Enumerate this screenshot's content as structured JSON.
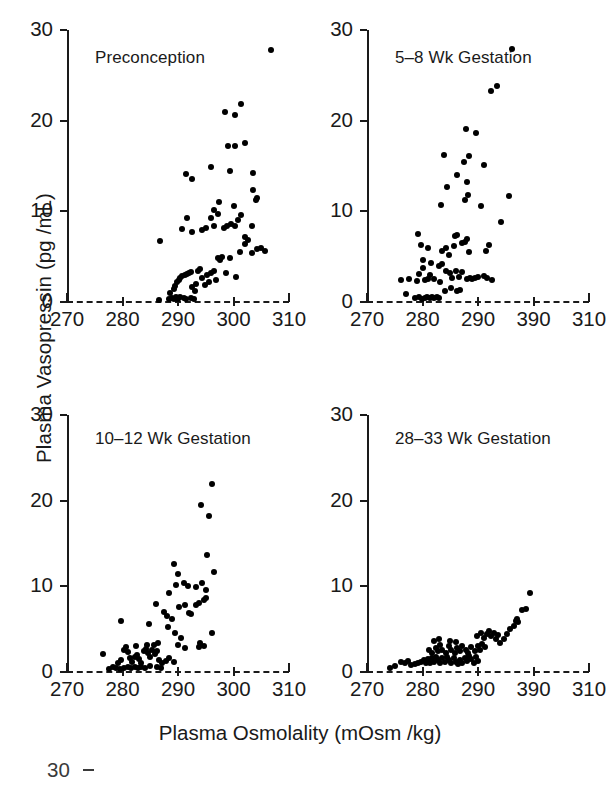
{
  "figure": {
    "xlabel": "Plasma Osmolality (mOsm /kg)",
    "ylabel": "Plasma Vasopressin (pg /mL)",
    "ink_color": "#1a1a1a",
    "marker_color": "#000000",
    "background": "#ffffff",
    "next_figure_fragment": {
      "ytick_label": "30"
    }
  },
  "chart_data": [
    {
      "type": "scatter",
      "title": "Preconception",
      "panel": "top-left",
      "xlabel": "Plasma Osmolality (mOsm /kg)",
      "ylabel": "Plasma Vasopressin (pg /mL)",
      "xlim": [
        270,
        310
      ],
      "ylim": [
        0,
        30
      ],
      "xticks": [
        270,
        280,
        290,
        300,
        310
      ],
      "xtick_labels": [
        "270",
        "280",
        "290",
        "300",
        "310"
      ],
      "yticks": [
        0,
        10,
        20,
        30
      ],
      "ytick_labels": [
        "0",
        "10",
        "20",
        "30"
      ],
      "grid": false,
      "legend": "none",
      "baseline_style": "dashed",
      "points": [
        [
          286.6,
          0.2
        ],
        [
          288.4,
          0.3
        ],
        [
          288.9,
          0.4
        ],
        [
          289.3,
          0.3
        ],
        [
          289.6,
          0.5
        ],
        [
          290.0,
          0.3
        ],
        [
          290.3,
          0.6
        ],
        [
          291.0,
          0.4
        ],
        [
          291.4,
          0.3
        ],
        [
          292.4,
          0.4
        ],
        [
          292.8,
          0.3
        ],
        [
          288.6,
          1.0
        ],
        [
          289.2,
          1.4
        ],
        [
          289.5,
          1.8
        ],
        [
          289.8,
          2.2
        ],
        [
          290.1,
          2.4
        ],
        [
          290.4,
          2.6
        ],
        [
          290.7,
          2.9
        ],
        [
          291.2,
          3.0
        ],
        [
          291.6,
          3.1
        ],
        [
          292.0,
          3.2
        ],
        [
          292.3,
          3.3
        ],
        [
          292.6,
          1.6
        ],
        [
          293.0,
          1.2
        ],
        [
          293.3,
          2.0
        ],
        [
          293.6,
          3.4
        ],
        [
          293.9,
          3.6
        ],
        [
          294.3,
          2.6
        ],
        [
          294.8,
          1.9
        ],
        [
          295.2,
          3.0
        ],
        [
          295.6,
          2.2
        ],
        [
          296.0,
          3.2
        ],
        [
          296.4,
          3.4
        ],
        [
          296.8,
          2.4
        ],
        [
          297.2,
          4.8
        ],
        [
          297.6,
          4.6
        ],
        [
          298.0,
          5.0
        ],
        [
          298.6,
          3.2
        ],
        [
          299.3,
          4.9
        ],
        [
          300.4,
          2.8
        ],
        [
          301.2,
          5.5
        ],
        [
          302.0,
          6.4
        ],
        [
          303.4,
          5.4
        ],
        [
          304.3,
          5.8
        ],
        [
          305.0,
          6.0
        ],
        [
          305.6,
          5.6
        ],
        [
          286.8,
          6.7
        ],
        [
          290.8,
          8.0
        ],
        [
          291.6,
          9.3
        ],
        [
          292.6,
          7.7
        ],
        [
          294.4,
          7.9
        ],
        [
          295.0,
          8.2
        ],
        [
          296.0,
          9.3
        ],
        [
          296.5,
          8.4
        ],
        [
          297.2,
          9.7
        ],
        [
          298.2,
          8.2
        ],
        [
          298.8,
          8.4
        ],
        [
          299.5,
          8.6
        ],
        [
          300.2,
          8.4
        ],
        [
          300.8,
          9.0
        ],
        [
          301.3,
          9.6
        ],
        [
          302.0,
          7.2
        ],
        [
          302.6,
          6.8
        ],
        [
          303.4,
          8.4
        ],
        [
          304.0,
          11.2
        ],
        [
          304.2,
          11.5
        ],
        [
          303.6,
          12.4
        ],
        [
          300.0,
          10.6
        ],
        [
          297.3,
          11.0
        ],
        [
          296.4,
          10.2
        ],
        [
          291.4,
          14.1
        ],
        [
          292.6,
          13.6
        ],
        [
          295.9,
          14.9
        ],
        [
          299.4,
          14.5
        ],
        [
          303.6,
          14.2
        ],
        [
          299.0,
          17.2
        ],
        [
          300.2,
          17.2
        ],
        [
          302.0,
          17.5
        ],
        [
          300.3,
          20.6
        ],
        [
          298.4,
          21.0
        ],
        [
          301.3,
          21.8
        ],
        [
          306.8,
          27.8
        ]
      ]
    },
    {
      "type": "scatter",
      "title": "5–8 Wk Gestation",
      "panel": "top-right",
      "xlabel": "Plasma Osmolality (mOsm /kg)",
      "ylabel": "Plasma Vasopressin (pg /mL)",
      "xlim": [
        270,
        310
      ],
      "ylim": [
        0,
        30
      ],
      "xticks": [
        270,
        280,
        290,
        300,
        310
      ],
      "xtick_labels": [
        "270",
        "280",
        "290",
        "390",
        "310"
      ],
      "yticks": [
        0,
        10,
        20,
        30
      ],
      "ytick_labels": [
        "0",
        "10",
        "20",
        "30"
      ],
      "grid": false,
      "legend": "none",
      "baseline_style": "dashed",
      "points": [
        [
          278.6,
          0.4
        ],
        [
          279.4,
          0.5
        ],
        [
          279.9,
          0.3
        ],
        [
          280.4,
          0.4
        ],
        [
          280.9,
          0.5
        ],
        [
          281.3,
          0.4
        ],
        [
          281.7,
          0.5
        ],
        [
          282.1,
          0.4
        ],
        [
          282.6,
          0.5
        ],
        [
          283.0,
          0.4
        ],
        [
          277.0,
          0.9
        ],
        [
          276.2,
          2.4
        ],
        [
          277.6,
          2.5
        ],
        [
          279.0,
          2.3
        ],
        [
          279.4,
          3.1
        ],
        [
          280.0,
          3.7
        ],
        [
          280.4,
          2.4
        ],
        [
          281.0,
          2.5
        ],
        [
          281.4,
          3.0
        ],
        [
          282.0,
          2.5
        ],
        [
          283.1,
          2.2
        ],
        [
          284.0,
          1.2
        ],
        [
          285.2,
          1.5
        ],
        [
          286.2,
          1.2
        ],
        [
          286.8,
          1.3
        ],
        [
          280.0,
          4.6
        ],
        [
          281.6,
          4.3
        ],
        [
          283.0,
          4.0
        ],
        [
          283.6,
          4.2
        ],
        [
          284.2,
          3.4
        ],
        [
          285.0,
          3.2
        ],
        [
          285.4,
          2.6
        ],
        [
          286.0,
          3.4
        ],
        [
          286.6,
          2.8
        ],
        [
          287.2,
          3.3
        ],
        [
          288.0,
          2.5
        ],
        [
          288.6,
          2.6
        ],
        [
          289.0,
          2.5
        ],
        [
          289.4,
          2.6
        ],
        [
          290.0,
          2.8
        ],
        [
          291.0,
          2.9
        ],
        [
          291.6,
          2.6
        ],
        [
          292.6,
          2.4
        ],
        [
          279.8,
          6.3
        ],
        [
          279.2,
          7.5
        ],
        [
          281.0,
          6.0
        ],
        [
          283.6,
          5.6
        ],
        [
          284.2,
          6.0
        ],
        [
          284.8,
          5.2
        ],
        [
          285.6,
          6.2
        ],
        [
          285.9,
          7.3
        ],
        [
          286.2,
          7.4
        ],
        [
          287.2,
          6.5
        ],
        [
          287.6,
          6.6
        ],
        [
          288.0,
          7.0
        ],
        [
          288.4,
          5.5
        ],
        [
          291.4,
          5.6
        ],
        [
          292.0,
          6.3
        ],
        [
          294.2,
          8.8
        ],
        [
          283.4,
          10.7
        ],
        [
          287.6,
          11.3
        ],
        [
          288.2,
          11.8
        ],
        [
          295.6,
          11.7
        ],
        [
          290.6,
          10.6
        ],
        [
          284.4,
          12.7
        ],
        [
          288.0,
          13.2
        ],
        [
          286.2,
          14.0
        ],
        [
          283.8,
          16.2
        ],
        [
          287.4,
          15.4
        ],
        [
          288.4,
          16.1
        ],
        [
          291.0,
          15.1
        ],
        [
          287.8,
          19.1
        ],
        [
          289.6,
          18.6
        ],
        [
          292.4,
          23.3
        ],
        [
          293.4,
          23.8
        ],
        [
          296.2,
          27.9
        ]
      ]
    },
    {
      "type": "scatter",
      "title": "10–12 Wk Gestation",
      "panel": "bottom-left",
      "xlabel": "Plasma Osmolality (mOsm /kg)",
      "ylabel": "Plasma Vasopressin (pg /mL)",
      "xlim": [
        270,
        310
      ],
      "ylim": [
        0,
        30
      ],
      "xticks": [
        270,
        280,
        290,
        300,
        310
      ],
      "xtick_labels": [
        "270",
        "280",
        "290",
        "300",
        "310"
      ],
      "yticks": [
        0,
        10,
        20,
        30
      ],
      "ytick_labels": [
        "0",
        "10",
        "20",
        "30"
      ],
      "grid": false,
      "legend": "none",
      "baseline_style": "dashed",
      "points": [
        [
          277.6,
          0.4
        ],
        [
          278.2,
          0.6
        ],
        [
          278.8,
          0.5
        ],
        [
          279.6,
          0.4
        ],
        [
          280.2,
          0.5
        ],
        [
          281.0,
          0.6
        ],
        [
          281.6,
          0.5
        ],
        [
          282.2,
          0.6
        ],
        [
          282.8,
          0.5
        ],
        [
          283.4,
          0.6
        ],
        [
          284.0,
          0.5
        ],
        [
          285.0,
          0.7
        ],
        [
          286.2,
          0.6
        ],
        [
          287.0,
          0.5
        ],
        [
          276.4,
          2.1
        ],
        [
          279.2,
          1.0
        ],
        [
          279.8,
          1.4
        ],
        [
          280.2,
          2.6
        ],
        [
          280.6,
          2.9
        ],
        [
          281.0,
          2.3
        ],
        [
          281.4,
          1.6
        ],
        [
          281.8,
          1.2
        ],
        [
          282.2,
          1.8
        ],
        [
          282.6,
          2.0
        ],
        [
          283.0,
          1.5
        ],
        [
          283.4,
          1.1
        ],
        [
          283.8,
          2.4
        ],
        [
          284.2,
          2.7
        ],
        [
          284.6,
          2.2
        ],
        [
          285.0,
          1.8
        ],
        [
          285.4,
          2.6
        ],
        [
          285.8,
          2.1
        ],
        [
          286.2,
          2.5
        ],
        [
          286.6,
          1.4
        ],
        [
          287.2,
          1.1
        ],
        [
          287.8,
          1.3
        ],
        [
          288.4,
          1.6
        ],
        [
          289.2,
          1.2
        ],
        [
          282.4,
          3.0
        ],
        [
          284.4,
          3.1
        ],
        [
          285.6,
          3.2
        ],
        [
          286.4,
          3.4
        ],
        [
          290.0,
          3.1
        ],
        [
          291.2,
          2.8
        ],
        [
          293.8,
          2.9
        ],
        [
          294.6,
          3.0
        ],
        [
          294.0,
          3.4
        ],
        [
          279.8,
          6.0
        ],
        [
          284.8,
          5.6
        ],
        [
          286.0,
          7.9
        ],
        [
          288.2,
          5.2
        ],
        [
          289.4,
          4.6
        ],
        [
          290.6,
          4.0
        ],
        [
          296.2,
          4.6
        ],
        [
          287.4,
          7.0
        ],
        [
          288.0,
          6.5
        ],
        [
          289.0,
          6.2
        ],
        [
          290.2,
          7.6
        ],
        [
          291.2,
          7.8
        ],
        [
          292.0,
          6.9
        ],
        [
          292.4,
          6.8
        ],
        [
          293.2,
          7.8
        ],
        [
          293.8,
          8.0
        ],
        [
          294.6,
          8.4
        ],
        [
          295.0,
          8.6
        ],
        [
          288.4,
          9.2
        ],
        [
          289.6,
          10.2
        ],
        [
          291.0,
          10.4
        ],
        [
          291.8,
          10.0
        ],
        [
          293.2,
          9.9
        ],
        [
          294.4,
          10.4
        ],
        [
          295.0,
          9.6
        ],
        [
          290.0,
          11.4
        ],
        [
          296.4,
          11.7
        ],
        [
          289.2,
          12.6
        ],
        [
          295.2,
          13.6
        ],
        [
          294.2,
          19.5
        ],
        [
          295.6,
          18.2
        ],
        [
          296.2,
          22.0
        ]
      ]
    },
    {
      "type": "scatter",
      "title": "28–33 Wk Gestation",
      "panel": "bottom-right",
      "xlabel": "Plasma Osmolality (mOsm /kg)",
      "ylabel": "Plasma Vasopressin (pg /mL)",
      "xlim": [
        270,
        310
      ],
      "ylim": [
        0,
        30
      ],
      "xticks": [
        270,
        280,
        290,
        300,
        310
      ],
      "xtick_labels": [
        "270",
        "280",
        "290",
        "390",
        "310"
      ],
      "yticks": [
        0,
        10,
        20,
        30
      ],
      "ytick_labels": [
        "0",
        "10",
        "20",
        "30"
      ],
      "grid": false,
      "legend": "none",
      "baseline_style": "dashed",
      "points": [
        [
          274.2,
          0.5
        ],
        [
          275.0,
          0.7
        ],
        [
          276.2,
          1.2
        ],
        [
          276.8,
          1.0
        ],
        [
          277.4,
          1.3
        ],
        [
          278.0,
          0.8
        ],
        [
          278.6,
          0.9
        ],
        [
          279.2,
          1.0
        ],
        [
          279.8,
          1.2
        ],
        [
          280.2,
          1.4
        ],
        [
          280.6,
          1.0
        ],
        [
          281.0,
          1.5
        ],
        [
          281.4,
          1.1
        ],
        [
          281.8,
          1.6
        ],
        [
          282.0,
          1.2
        ],
        [
          282.4,
          1.8
        ],
        [
          282.8,
          1.4
        ],
        [
          283.2,
          1.0
        ],
        [
          283.6,
          1.6
        ],
        [
          284.0,
          1.2
        ],
        [
          284.4,
          1.8
        ],
        [
          284.8,
          1.4
        ],
        [
          285.2,
          1.0
        ],
        [
          285.6,
          1.6
        ],
        [
          286.0,
          1.2
        ],
        [
          286.4,
          0.9
        ],
        [
          286.8,
          1.4
        ],
        [
          287.2,
          1.1
        ],
        [
          287.6,
          1.6
        ],
        [
          288.0,
          1.3
        ],
        [
          288.4,
          1.9
        ],
        [
          288.8,
          1.5
        ],
        [
          289.2,
          1.1
        ],
        [
          289.6,
          1.7
        ],
        [
          290.0,
          1.3
        ],
        [
          281.2,
          2.6
        ],
        [
          281.8,
          2.2
        ],
        [
          282.4,
          2.8
        ],
        [
          282.8,
          2.4
        ],
        [
          283.2,
          3.2
        ],
        [
          283.6,
          2.6
        ],
        [
          284.2,
          2.2
        ],
        [
          284.8,
          3.0
        ],
        [
          285.2,
          2.6
        ],
        [
          285.8,
          2.2
        ],
        [
          286.2,
          2.8
        ],
        [
          286.8,
          2.4
        ],
        [
          287.2,
          3.0
        ],
        [
          287.8,
          2.6
        ],
        [
          288.2,
          2.2
        ],
        [
          288.8,
          2.9
        ],
        [
          289.4,
          2.5
        ],
        [
          290.0,
          3.0
        ],
        [
          290.4,
          2.6
        ],
        [
          290.8,
          3.3
        ],
        [
          291.2,
          2.9
        ],
        [
          282.0,
          3.6
        ],
        [
          283.0,
          3.8
        ],
        [
          285.0,
          3.6
        ],
        [
          286.0,
          3.5
        ],
        [
          289.8,
          4.2
        ],
        [
          290.6,
          4.6
        ],
        [
          291.0,
          4.0
        ],
        [
          291.6,
          4.4
        ],
        [
          292.0,
          4.8
        ],
        [
          292.4,
          4.2
        ],
        [
          292.8,
          4.6
        ],
        [
          293.2,
          3.8
        ],
        [
          293.6,
          4.3
        ],
        [
          294.0,
          3.4
        ],
        [
          294.6,
          3.8
        ],
        [
          295.2,
          4.4
        ],
        [
          295.8,
          5.0
        ],
        [
          296.4,
          5.4
        ],
        [
          296.8,
          6.0
        ],
        [
          297.0,
          6.2
        ],
        [
          297.2,
          5.8
        ],
        [
          298.0,
          7.2
        ],
        [
          298.6,
          7.4
        ],
        [
          299.4,
          9.2
        ]
      ]
    }
  ]
}
